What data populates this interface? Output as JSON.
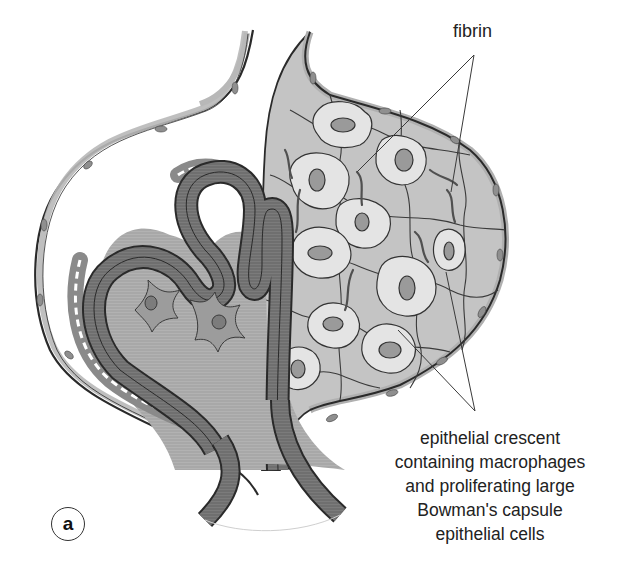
{
  "figure": {
    "panel_letter": "a"
  },
  "labels": {
    "fibrin": "fibrin",
    "crescent": {
      "lines": [
        "epithelial crescent",
        "containing macrophages",
        "and proliferating large",
        "Bowman's capsule",
        "epithelial cells"
      ]
    }
  },
  "pointers": {
    "fibrin": {
      "apex": [
        474,
        55
      ],
      "targets": [
        [
          357,
          172
        ],
        [
          451,
          192
        ]
      ]
    },
    "crescent": {
      "apex": [
        475,
        411
      ],
      "targets": [
        [
          398,
          330
        ],
        [
          446,
          272
        ]
      ]
    }
  },
  "colors": {
    "background": "#ffffff",
    "outline": "#2a2a2a",
    "capsule_wall": "#b8b8b8",
    "capillary_loop": "#6f6f6f",
    "capillary_lumen": "#a9a9a9",
    "podocyte_layer": "#8a8a8a",
    "mesangium": "#9c9c9c",
    "crescent_fill": "#c4c4c4",
    "large_cell_fill": "#e4e4e4",
    "nucleus": "#9a9a9a",
    "fibrin_strand": "#555555",
    "text": "#222222"
  }
}
